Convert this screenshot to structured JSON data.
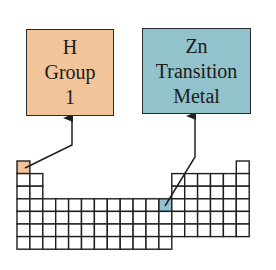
{
  "colors": {
    "group1_fill": "#F2C49A",
    "transition_fill": "#92C3CC",
    "line": "#1f1f1f",
    "cell_fill": "#ffffff"
  },
  "callouts": [
    {
      "id": "h",
      "lines": [
        "H",
        "Group",
        "1"
      ],
      "fill": "#F2C49A",
      "target_cell": {
        "row": 1,
        "col": 1
      },
      "arrow_points": [
        [
          25,
          168
        ],
        [
          72,
          145
        ],
        [
          72,
          118
        ]
      ]
    },
    {
      "id": "zn",
      "lines": [
        "Zn",
        "Transition",
        "Metal"
      ],
      "fill": "#92C3CC",
      "target_cell": {
        "row": 4,
        "col": 12
      },
      "arrow_points": [
        [
          165,
          206
        ],
        [
          195,
          157
        ],
        [
          195,
          116
        ]
      ]
    }
  ],
  "periodic_table": {
    "origin": [
      17,
      161
    ],
    "cell_w": 12.9,
    "cell_h": 12.6,
    "columns": 18,
    "row_layout": [
      {
        "row": 1,
        "cols": [
          1,
          18
        ]
      },
      {
        "row": 2,
        "cols": [
          1,
          2,
          13,
          14,
          15,
          16,
          17,
          18
        ]
      },
      {
        "row": 3,
        "cols": [
          1,
          2,
          13,
          14,
          15,
          16,
          17,
          18
        ]
      },
      {
        "row": 4,
        "cols": [
          1,
          2,
          3,
          4,
          5,
          6,
          7,
          8,
          9,
          10,
          11,
          12,
          13,
          14,
          15,
          16,
          17,
          18
        ]
      },
      {
        "row": 5,
        "cols": [
          1,
          2,
          3,
          4,
          5,
          6,
          7,
          8,
          9,
          10,
          11,
          12,
          13,
          14,
          15,
          16,
          17,
          18
        ]
      },
      {
        "row": 6,
        "cols": [
          1,
          2,
          3,
          4,
          5,
          6,
          7,
          8,
          9,
          10,
          11,
          12,
          13,
          14,
          15,
          16,
          17,
          18
        ]
      },
      {
        "row": 7,
        "cols": [
          1,
          2,
          3,
          4,
          5,
          6,
          7,
          8,
          9,
          10,
          11,
          12
        ]
      }
    ]
  }
}
